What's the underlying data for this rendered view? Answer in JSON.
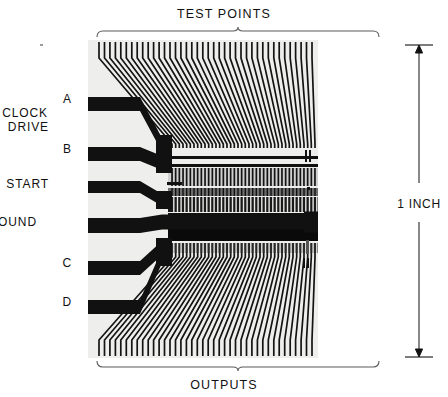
{
  "figure": {
    "title_top": "TEST POINTS",
    "title_bottom": "OUTPUTS",
    "scale_label": "1 INCH",
    "background_color": "#ffffff",
    "die_color": "#eeeeec",
    "metal_color": "#111111",
    "die_rect": {
      "x": 88,
      "y": 40,
      "width": 230,
      "height": 318
    }
  },
  "pad_labels": [
    {
      "id": "A",
      "text": "A",
      "x": 72,
      "y": 103
    },
    {
      "id": "clock-drive",
      "text": "CLOCK",
      "x": 48,
      "y": 117
    },
    {
      "id": "clock-drive2",
      "text": "DRIVE",
      "x": 49,
      "y": 131
    },
    {
      "id": "B",
      "text": "B",
      "x": 72,
      "y": 153
    },
    {
      "id": "START",
      "text": "START",
      "x": 49,
      "y": 188
    },
    {
      "id": "GROUND",
      "text": "GROUND",
      "x": 37,
      "y": 226
    },
    {
      "id": "C",
      "text": "C",
      "x": 72,
      "y": 267
    },
    {
      "id": "D",
      "text": "D",
      "x": 72,
      "y": 306
    }
  ],
  "pads": [
    {
      "name": "pad-a",
      "label": "A",
      "y": 97,
      "height": 14,
      "x": 88,
      "width": 52,
      "route_to_y": 145,
      "route_end_x": 170
    },
    {
      "name": "pad-b",
      "label": "B",
      "y": 147,
      "height": 14,
      "x": 88,
      "width": 52,
      "route_to_y": 163,
      "route_end_x": 170
    },
    {
      "name": "pad-start",
      "label": "START",
      "y": 181,
      "height": 12,
      "x": 88,
      "width": 52,
      "route_to_y": 200,
      "route_end_x": 170
    },
    {
      "name": "pad-ground",
      "label": "GROUND",
      "y": 218,
      "height": 15,
      "x": 88,
      "width": 52,
      "route_to_y": 222,
      "route_end_x": 318
    },
    {
      "name": "pad-c",
      "label": "C",
      "y": 261,
      "height": 14,
      "x": 88,
      "width": 52,
      "route_to_y": 248,
      "route_end_x": 170
    },
    {
      "name": "pad-d",
      "label": "D",
      "y": 300,
      "height": 14,
      "x": 88,
      "width": 52,
      "route_to_y": 256,
      "route_end_x": 170
    }
  ],
  "test_points": {
    "count": 40,
    "top_edge_y": 42,
    "stub_bottom_y": 58,
    "core_top_y": 148,
    "left_x": 99,
    "right_x": 312,
    "core_left_x": 172,
    "core_right_x": 315
  },
  "outputs": {
    "count": 40,
    "bottom_edge_y": 356,
    "stub_top_y": 340,
    "core_bottom_y": 253,
    "left_x": 99,
    "right_x": 312,
    "core_left_x": 172,
    "core_right_x": 315
  },
  "core_bars": [
    {
      "name": "bus-bar-1",
      "y": 156,
      "height": 3,
      "shade": "#111111"
    },
    {
      "name": "bus-bar-2",
      "y": 164,
      "height": 3,
      "shade": "#111111"
    },
    {
      "name": "cell-row-1",
      "y": 168,
      "height": 18,
      "shade": "#cfcfcf"
    },
    {
      "name": "cell-row-2",
      "y": 188,
      "height": 8,
      "shade": "#6e6e6e"
    },
    {
      "name": "cell-row-3",
      "y": 197,
      "height": 15,
      "shade": "#1a1a1a"
    },
    {
      "name": "bus-bar-3",
      "y": 213,
      "height": 3,
      "shade": "#111111"
    },
    {
      "name": "cell-row-4",
      "y": 217,
      "height": 10,
      "shade": "#2a2a2a"
    },
    {
      "name": "bus-bar-4",
      "y": 228,
      "height": 13,
      "shade": "#0a0a0a"
    },
    {
      "name": "cell-row-5",
      "y": 243,
      "height": 10,
      "shade": "#2a2a2a"
    }
  ],
  "brackets": {
    "top": {
      "x1": 96,
      "x2": 378,
      "y": 30,
      "tip_x": 238
    },
    "bottom": {
      "x1": 96,
      "x2": 378,
      "y": 368,
      "tip_x": 238
    }
  },
  "dimension": {
    "x": 412,
    "y_top": 45,
    "y_bottom": 357,
    "label": "1 INCH",
    "label_x": 410,
    "label_y": 205
  },
  "speck": {
    "x": 40,
    "y": 44
  }
}
